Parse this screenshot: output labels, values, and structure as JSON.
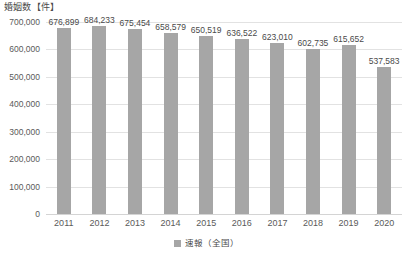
{
  "chart_data": {
    "type": "bar",
    "title": "婚姻数【件】",
    "xlabel": "",
    "ylabel": "",
    "categories": [
      "2011",
      "2012",
      "2013",
      "2014",
      "2015",
      "2016",
      "2017",
      "2018",
      "2019",
      "2020"
    ],
    "series": [
      {
        "name": "速報（全国）",
        "values": [
          676899,
          684233,
          675454,
          658579,
          650519,
          636522,
          623010,
          602735,
          615652,
          537583
        ]
      }
    ],
    "value_labels": [
      "676,899",
      "684,233",
      "675,454",
      "658,579",
      "650,519",
      "636,522",
      "623,010",
      "602,735",
      "615,652",
      "537,583"
    ],
    "ylim": [
      0,
      700000
    ],
    "ytick_values": [
      0,
      100000,
      200000,
      300000,
      400000,
      500000,
      600000,
      700000
    ],
    "ytick_labels": [
      "0",
      "100,000",
      "200,000",
      "300,000",
      "400,000",
      "500,000",
      "600,000",
      "700,000"
    ],
    "grid": true,
    "legend_position": "bottom",
    "bar_color": "#a6a6a6",
    "gridline_color": "#e2e2e2",
    "text_color": "#5a5a5a"
  },
  "legend": {
    "entries": [
      {
        "label": "速報（全国）",
        "color": "#a6a6a6",
        "marker": "square-marker"
      }
    ]
  }
}
